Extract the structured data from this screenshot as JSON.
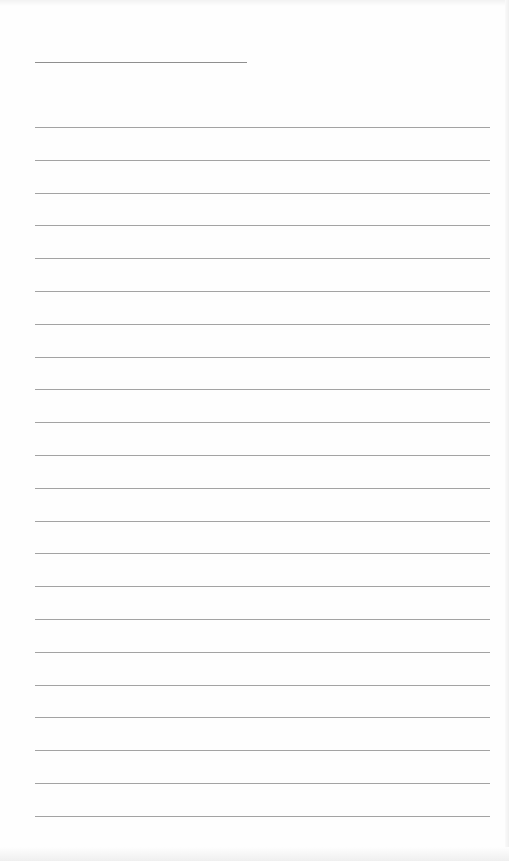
{
  "page": {
    "type": "lined-paper",
    "background_color": "#fefefe",
    "line_color": "#a3a3a3",
    "header_line": {
      "label": "",
      "x": 35,
      "y": 62,
      "width": 212
    },
    "ruled_lines": {
      "count": 22,
      "first_y": 127,
      "spacing": 32.8,
      "x": 35,
      "width": 455
    }
  }
}
